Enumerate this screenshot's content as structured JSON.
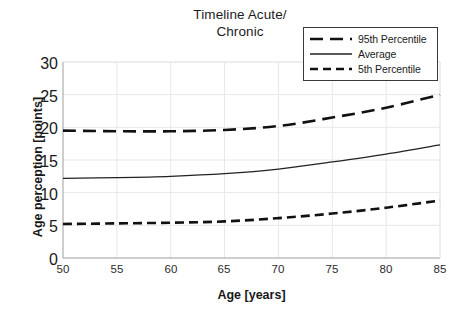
{
  "chart_data": {
    "type": "line",
    "title": "Timeline Acute/ Chronic",
    "title_lines": [
      "Timeline Acute/",
      "Chronic"
    ],
    "xlabel": "Age [years]",
    "ylabel": "Age perception [points]",
    "xlim": [
      50,
      85
    ],
    "ylim": [
      0,
      30
    ],
    "xticks": [
      50,
      55,
      60,
      65,
      70,
      75,
      80,
      85
    ],
    "yticks": [
      0,
      5,
      10,
      15,
      20,
      25,
      30
    ],
    "xtick_labels": [
      "50",
      "55",
      "60",
      "65",
      "70",
      "75",
      "80",
      "85"
    ],
    "ytick_labels": [
      "0",
      "5",
      "10",
      "15",
      "20",
      "25",
      "30"
    ],
    "grid": "horizontal-and-vertical-light",
    "legend_position": "top-right",
    "x": [
      50,
      55,
      60,
      65,
      70,
      75,
      80,
      85
    ],
    "series": [
      {
        "name": "95th Percentile",
        "style": "dashed-long",
        "color": "#111111",
        "width": 2.6,
        "values": [
          19.5,
          19.4,
          19.4,
          19.6,
          20.2,
          21.5,
          23.0,
          25.0
        ]
      },
      {
        "name": "Average",
        "style": "solid",
        "color": "#222222",
        "width": 1.3,
        "values": [
          12.2,
          12.3,
          12.5,
          12.9,
          13.6,
          14.7,
          15.9,
          17.3
        ]
      },
      {
        "name": "5th Percentile",
        "style": "dashed-short",
        "color": "#111111",
        "width": 2.6,
        "values": [
          5.2,
          5.3,
          5.4,
          5.6,
          6.1,
          6.8,
          7.7,
          8.8
        ]
      }
    ]
  },
  "legend": {
    "items": [
      {
        "label": "95th Percentile"
      },
      {
        "label": "Average"
      },
      {
        "label": "5th Percentile"
      }
    ]
  },
  "colors": {
    "line": "#111111",
    "average_line": "#222222",
    "grid": "#e8e8e8",
    "axis": "#c9c9c9",
    "text": "#1c1c1c"
  }
}
